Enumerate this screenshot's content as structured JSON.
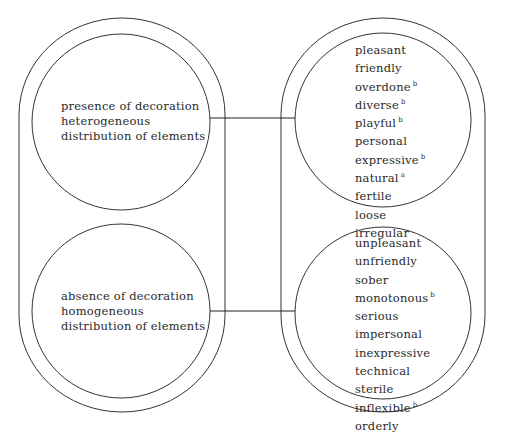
{
  "diagram": {
    "left_groups": [
      {
        "lines": [
          "presence of decoration",
          "heterogeneous",
          "distribution of elements"
        ]
      },
      {
        "lines": [
          "absence of decoration",
          "homogeneous",
          "distribution of elements"
        ]
      }
    ],
    "right_groups": [
      {
        "words": [
          {
            "text": "pleasant",
            "note": ""
          },
          {
            "text": "friendly",
            "note": ""
          },
          {
            "text": "overdone",
            "note": "b"
          },
          {
            "text": "diverse",
            "note": "b"
          },
          {
            "text": "playful",
            "note": "b"
          },
          {
            "text": "personal",
            "note": ""
          },
          {
            "text": "expressive",
            "note": "b"
          },
          {
            "text": "natural",
            "note": "a"
          },
          {
            "text": "fertile",
            "note": ""
          },
          {
            "text": "loose",
            "note": ""
          },
          {
            "text": "irregular",
            "note": ""
          }
        ]
      },
      {
        "words": [
          {
            "text": "unpleasant",
            "note": ""
          },
          {
            "text": "unfriendly",
            "note": ""
          },
          {
            "text": "sober",
            "note": ""
          },
          {
            "text": "monotonous",
            "note": "b"
          },
          {
            "text": "serious",
            "note": ""
          },
          {
            "text": "impersonal",
            "note": ""
          },
          {
            "text": "inexpressive",
            "note": ""
          },
          {
            "text": "technical",
            "note": ""
          },
          {
            "text": "sterile",
            "note": ""
          },
          {
            "text": "inflexible",
            "note": "b"
          },
          {
            "text": "orderly",
            "note": ""
          }
        ]
      }
    ],
    "line_color": "#333333"
  }
}
